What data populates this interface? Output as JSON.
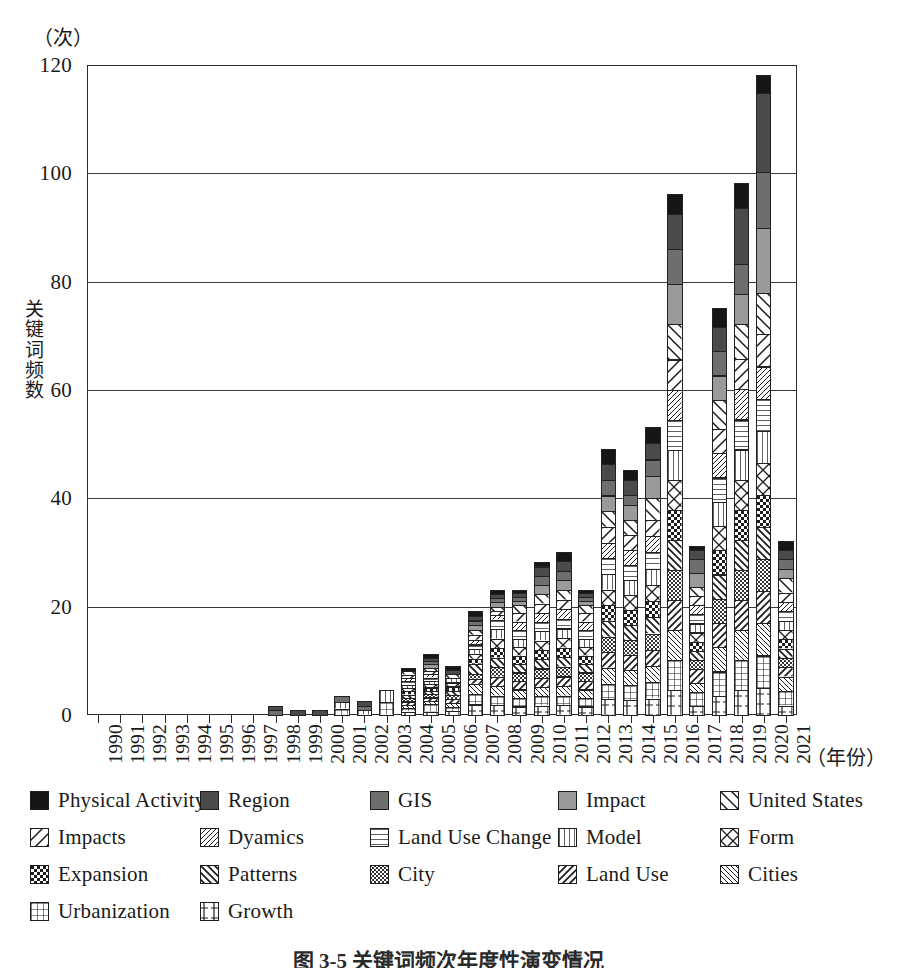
{
  "axes": {
    "y_unit": "（次）",
    "y_title": "关键词频数",
    "y_ticks": [
      "0",
      "20",
      "40",
      "60",
      "80",
      "100",
      "120"
    ],
    "x_unit": "（年份）"
  },
  "caption": "图 3-5  关键词频次年度性演变情况",
  "legend": {
    "rows": [
      [
        "Physical Activity",
        "Region",
        "GIS",
        "Impact",
        "United States"
      ],
      [
        "Impacts",
        "Dyamics",
        "Land Use Change",
        "Model",
        "Form"
      ],
      [
        "Expansion",
        "Patterns",
        "City",
        "Land Use",
        "Cities"
      ],
      [
        "Urbanization",
        "Growth"
      ]
    ]
  },
  "chart_data": {
    "type": "bar",
    "stacked": true,
    "title": "图 3-5  关键词频次年度性演变情况",
    "xlabel": "（年份）",
    "ylabel": "关键词频数",
    "yunit": "（次）",
    "ylim": [
      0,
      120
    ],
    "ytick_step": 20,
    "grid": true,
    "legend_position": "bottom",
    "categories": [
      "1990",
      "1991",
      "1992",
      "1993",
      "1994",
      "1995",
      "1996",
      "1997",
      "1998",
      "1999",
      "2000",
      "2001",
      "2002",
      "2003",
      "2004",
      "2005",
      "2006",
      "2007",
      "2008",
      "2009",
      "2010",
      "2011",
      "2012",
      "2013",
      "2014",
      "2015",
      "2016",
      "2017",
      "2018",
      "2019",
      "2020",
      "2021"
    ],
    "series": [
      {
        "name": "Growth",
        "fill": "#ffffff",
        "pattern": "growth",
        "values": [
          0,
          0,
          0,
          0,
          0,
          0,
          0,
          0,
          0,
          0,
          0,
          0,
          0,
          0,
          1,
          1,
          1,
          2,
          2,
          2,
          2,
          2,
          2,
          3,
          3,
          3,
          5,
          2,
          4,
          5,
          6,
          2
        ]
      },
      {
        "name": "Urbanization",
        "fill": "#ffffff",
        "pattern": "grid",
        "values": [
          0,
          0,
          0,
          0,
          0,
          0,
          0,
          0,
          0,
          0,
          0,
          1,
          0,
          1,
          1,
          2,
          1,
          2,
          2,
          2,
          2,
          2,
          2,
          3,
          3,
          3,
          6,
          3,
          5,
          6,
          7,
          3
        ]
      },
      {
        "name": "Cities",
        "fill": "#ffffff",
        "pattern": "diag-thin-l",
        "values": [
          0,
          0,
          0,
          0,
          0,
          0,
          0,
          0,
          0,
          0,
          0,
          0,
          0,
          0,
          1,
          1,
          1,
          2,
          2,
          2,
          2,
          2,
          2,
          3,
          3,
          3,
          6,
          2,
          5,
          6,
          7,
          3
        ]
      },
      {
        "name": "Land Use",
        "fill": "#ffffff",
        "pattern": "diag-med-r",
        "values": [
          0,
          0,
          0,
          0,
          0,
          0,
          0,
          0,
          0,
          0,
          0,
          0,
          0,
          0,
          1,
          1,
          1,
          1,
          2,
          2,
          2,
          2,
          2,
          3,
          3,
          3,
          6,
          3,
          5,
          6,
          7,
          2
        ]
      },
      {
        "name": "City",
        "fill": "#ffffff",
        "pattern": "cross-fine",
        "values": [
          0,
          0,
          0,
          0,
          0,
          0,
          0,
          0,
          0,
          0,
          0,
          0,
          0,
          0,
          1,
          1,
          1,
          1,
          2,
          2,
          2,
          2,
          2,
          3,
          3,
          3,
          6,
          2,
          5,
          6,
          7,
          2
        ]
      },
      {
        "name": "Patterns",
        "fill": "#ffffff",
        "pattern": "diag-med-l",
        "values": [
          0,
          0,
          0,
          0,
          0,
          0,
          0,
          0,
          0,
          0,
          0,
          0,
          0,
          0,
          1,
          1,
          1,
          2,
          2,
          2,
          2,
          2,
          2,
          3,
          3,
          3,
          6,
          2,
          5,
          6,
          7,
          2
        ]
      },
      {
        "name": "Expansion",
        "fill": "#ffffff",
        "pattern": "checker",
        "values": [
          0,
          0,
          0,
          0,
          0,
          0,
          0,
          0,
          0,
          0,
          0,
          0,
          0,
          0,
          1,
          1,
          1,
          1,
          2,
          2,
          2,
          2,
          2,
          3,
          3,
          3,
          6,
          2,
          5,
          6,
          7,
          2
        ]
      },
      {
        "name": "Form",
        "fill": "#ffffff",
        "pattern": "bowtie",
        "values": [
          0,
          0,
          0,
          0,
          0,
          0,
          0,
          0,
          0,
          0,
          0,
          0,
          0,
          0,
          1,
          1,
          1,
          1,
          2,
          2,
          2,
          2,
          2,
          3,
          3,
          3,
          6,
          2,
          5,
          6,
          7,
          2
        ]
      },
      {
        "name": "Model",
        "fill": "#ffffff",
        "pattern": "vert",
        "values": [
          0,
          0,
          0,
          0,
          0,
          0,
          0,
          0,
          0,
          0,
          0,
          1,
          1,
          1,
          1,
          1,
          1,
          1,
          2,
          2,
          2,
          2,
          2,
          3,
          3,
          3,
          6,
          2,
          5,
          6,
          7,
          2
        ]
      },
      {
        "name": "Land Use Change",
        "fill": "#ffffff",
        "pattern": "horiz",
        "values": [
          0,
          0,
          0,
          0,
          0,
          0,
          0,
          0,
          0,
          0,
          0,
          0,
          0,
          0,
          1,
          1,
          0,
          1,
          2,
          2,
          2,
          2,
          2,
          3,
          3,
          3,
          6,
          2,
          5,
          6,
          7,
          2
        ]
      },
      {
        "name": "Dyamics",
        "fill": "#ffffff",
        "pattern": "diag-thin-r",
        "values": [
          0,
          0,
          0,
          0,
          0,
          0,
          0,
          0,
          0,
          0,
          0,
          0,
          0,
          0,
          1,
          1,
          0,
          1,
          1,
          2,
          2,
          2,
          2,
          3,
          3,
          3,
          6,
          2,
          5,
          6,
          7,
          2
        ]
      },
      {
        "name": "Impacts",
        "fill": "#ffffff",
        "pattern": "diag-wide-r",
        "values": [
          0,
          0,
          0,
          0,
          0,
          0,
          0,
          0,
          0,
          0,
          0,
          0,
          0,
          0,
          1,
          1,
          0,
          1,
          1,
          2,
          2,
          2,
          2,
          3,
          3,
          3,
          6,
          2,
          5,
          6,
          7,
          2
        ]
      },
      {
        "name": "United States",
        "fill": "#ffffff",
        "pattern": "diag-wide-l",
        "values": [
          0,
          0,
          0,
          0,
          0,
          0,
          0,
          0,
          0,
          0,
          0,
          0,
          0,
          0,
          1,
          1,
          1,
          1,
          1,
          2,
          2,
          2,
          2,
          3,
          3,
          4,
          7,
          2,
          6,
          7,
          9,
          3
        ]
      },
      {
        "name": "Impact",
        "fill": "#9a9a9a",
        "pattern": "solid",
        "values": [
          0,
          0,
          0,
          0,
          0,
          0,
          0,
          0,
          0,
          0,
          0,
          0,
          0,
          0,
          0,
          1,
          0,
          1,
          1,
          1,
          2,
          2,
          1,
          3,
          3,
          4,
          8,
          3,
          5,
          6,
          14,
          2
        ]
      },
      {
        "name": "GIS",
        "fill": "#6e6e6e",
        "pattern": "solid",
        "values": [
          0,
          0,
          0,
          0,
          0,
          0,
          0,
          0,
          1,
          0,
          0,
          1,
          1,
          0,
          0,
          1,
          0,
          1,
          1,
          1,
          2,
          2,
          1,
          3,
          2,
          3,
          7,
          3,
          5,
          6,
          12,
          2
        ]
      },
      {
        "name": "Region",
        "fill": "#4a4a4a",
        "pattern": "solid",
        "values": [
          0,
          0,
          0,
          0,
          0,
          0,
          0,
          0,
          1,
          1,
          1,
          0,
          1,
          0,
          0,
          1,
          1,
          1,
          1,
          1,
          2,
          2,
          1,
          3,
          3,
          3,
          7,
          2,
          5,
          11,
          17,
          2
        ]
      },
      {
        "name": "Physical Activity",
        "fill": "#161616",
        "pattern": "solid",
        "values": [
          0,
          0,
          0,
          0,
          0,
          0,
          0,
          0,
          0,
          0,
          0,
          0,
          0,
          0,
          1,
          1,
          1,
          1,
          1,
          1,
          1,
          2,
          1,
          3,
          2,
          3,
          4,
          1,
          4,
          5,
          4,
          2
        ]
      }
    ],
    "totals": [
      0,
      0,
      0,
      0,
      0,
      0,
      0,
      0,
      2,
      1,
      1,
      3,
      3,
      3,
      11,
      17,
      10,
      22,
      25,
      28,
      31,
      33,
      28,
      52,
      48,
      56,
      105,
      35,
      82,
      107,
      139,
      37
    ],
    "totals_observed": [
      0,
      0,
      0,
      0,
      0,
      0,
      0,
      0,
      2,
      1,
      1,
      4,
      3,
      5,
      11,
      14,
      11,
      22,
      26,
      26,
      31,
      33,
      26,
      52,
      48,
      56,
      99,
      34,
      78,
      101,
      121,
      35
    ]
  }
}
